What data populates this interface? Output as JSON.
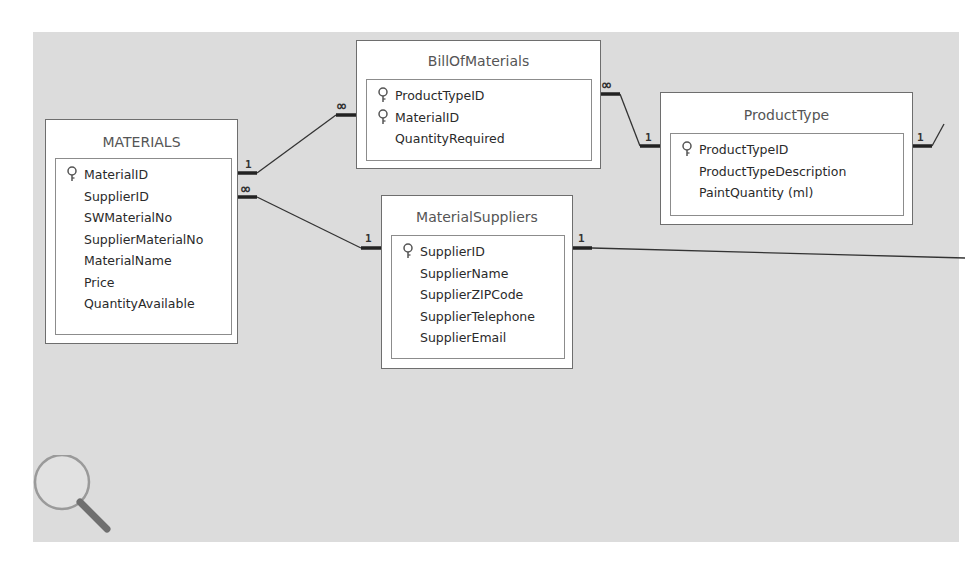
{
  "diagram": {
    "type": "relationships",
    "tables": [
      {
        "id": "materials",
        "name": "MATERIALS",
        "fields": [
          {
            "name": "MaterialID",
            "primary_key": true
          },
          {
            "name": "SupplierID",
            "primary_key": false
          },
          {
            "name": "SWMaterialNo",
            "primary_key": false
          },
          {
            "name": "SupplierMaterialNo",
            "primary_key": false
          },
          {
            "name": "MaterialName",
            "primary_key": false
          },
          {
            "name": "Price",
            "primary_key": false
          },
          {
            "name": "QuantityAvailable",
            "primary_key": false
          }
        ]
      },
      {
        "id": "billofmaterials",
        "name": "BillOfMaterials",
        "fields": [
          {
            "name": "ProductTypeID",
            "primary_key": true
          },
          {
            "name": "MaterialID",
            "primary_key": true
          },
          {
            "name": "QuantityRequired",
            "primary_key": false
          }
        ]
      },
      {
        "id": "producttype",
        "name": "ProductType",
        "fields": [
          {
            "name": "ProductTypeID",
            "primary_key": true
          },
          {
            "name": "ProductTypeDescription",
            "primary_key": false
          },
          {
            "name": "PaintQuantity (ml)",
            "primary_key": false
          }
        ]
      },
      {
        "id": "materialsuppliers",
        "name": "MaterialSuppliers",
        "fields": [
          {
            "name": "SupplierID",
            "primary_key": true
          },
          {
            "name": "SupplierName",
            "primary_key": false
          },
          {
            "name": "SupplierZIPCode",
            "primary_key": false
          },
          {
            "name": "SupplierTelephone",
            "primary_key": false
          },
          {
            "name": "SupplierEmail",
            "primary_key": false
          }
        ]
      }
    ],
    "relationships": [
      {
        "from": "MATERIALS.MaterialID",
        "from_card": "1",
        "to": "BillOfMaterials.MaterialID",
        "to_card": "∞"
      },
      {
        "from": "BillOfMaterials.ProductTypeID",
        "from_card": "∞",
        "to": "ProductType.ProductTypeID",
        "to_card": "1"
      },
      {
        "from": "MATERIALS.SupplierID",
        "from_card": "∞",
        "to": "MaterialSuppliers.SupplierID",
        "to_card": "1"
      },
      {
        "from": "MaterialSuppliers.SupplierID",
        "from_card": "1",
        "to": "offscreen",
        "to_card": ""
      },
      {
        "from": "ProductType",
        "from_card": "1",
        "to": "offscreen",
        "to_card": ""
      }
    ],
    "cardinality_labels": {
      "one": "1",
      "many": "∞"
    }
  },
  "icons": {
    "primary_key": "key-icon",
    "zoom": "magnifier-icon"
  }
}
